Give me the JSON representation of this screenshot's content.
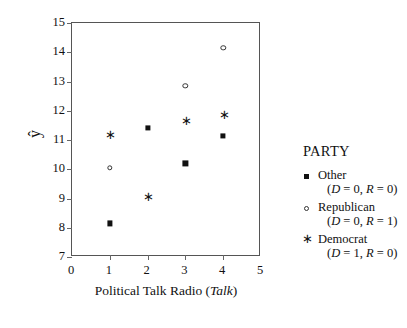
{
  "chart_data": {
    "type": "scatter",
    "title": "",
    "xlabel": "Political Talk Radio (Talk)",
    "xlabel_plain": "Political Talk Radio (",
    "xlabel_italic": "Talk",
    "xlabel_tail": ")",
    "ylabel": "ŷ",
    "xlim": [
      0,
      5
    ],
    "ylim": [
      7,
      15
    ],
    "xticks": [
      0,
      1,
      2,
      3,
      4,
      5
    ],
    "yticks": [
      7,
      8,
      9,
      10,
      11,
      12,
      13,
      14,
      15
    ],
    "grid": false,
    "legend_position": "right",
    "legend_title": "PARTY",
    "series": [
      {
        "name": "Other",
        "marker": "filled-square",
        "condition": "(D = 0, R = 0)",
        "x": [
          1,
          2,
          3,
          4
        ],
        "values": [
          8.15,
          11.4,
          10.2,
          11.15
        ]
      },
      {
        "name": "Republican",
        "marker": "open-circle",
        "condition": "(D = 0, R = 1)",
        "x": [
          1,
          3,
          4
        ],
        "values": [
          10.05,
          12.85,
          14.15
        ]
      },
      {
        "name": "Democrat",
        "marker": "asterisk",
        "condition": "(D = 1, R = 0)",
        "x": [
          1,
          2,
          3,
          4
        ],
        "values": [
          11.2,
          9.1,
          11.7,
          11.9
        ]
      }
    ],
    "points": [
      {
        "series": "Democrat",
        "marker": "asterisk",
        "x": 1,
        "y": 11.2
      },
      {
        "series": "Republican",
        "marker": "open-circle",
        "x": 1,
        "y": 10.05
      },
      {
        "series": "Other",
        "marker": "filled-square",
        "x": 1,
        "y": 8.15
      },
      {
        "series": "Other",
        "marker": "filled-square",
        "x": 2,
        "y": 11.4
      },
      {
        "series": "Democrat",
        "marker": "asterisk",
        "x": 2,
        "y": 9.1
      },
      {
        "series": "Republican",
        "marker": "open-circle",
        "x": 3,
        "y": 12.85
      },
      {
        "series": "Democrat",
        "marker": "asterisk",
        "x": 3,
        "y": 11.7
      },
      {
        "series": "Other",
        "marker": "filled-square",
        "x": 3,
        "y": 10.2
      },
      {
        "series": "Republican",
        "marker": "open-circle",
        "x": 4,
        "y": 14.15
      },
      {
        "series": "Democrat",
        "marker": "asterisk",
        "x": 4,
        "y": 11.9
      },
      {
        "series": "Other",
        "marker": "filled-square",
        "x": 4,
        "y": 11.15
      }
    ],
    "asterisk_glyph": "∗"
  }
}
